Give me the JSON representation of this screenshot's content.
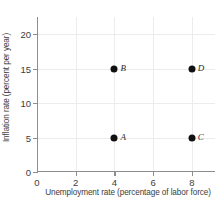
{
  "chart_data": {
    "type": "scatter",
    "title": "",
    "xlabel": "Unemployment rate (percentage of labor force)",
    "ylabel": "Inflation rate (percent per year)",
    "xlim": [
      0,
      9.2
    ],
    "ylim": [
      0,
      22.5
    ],
    "xticks": [
      0,
      2,
      4,
      6,
      8
    ],
    "yticks": [
      0,
      5,
      10,
      15,
      20
    ],
    "xtick_labels": [
      "0",
      "2",
      "4",
      "6",
      "8"
    ],
    "ytick_labels": [
      "0",
      "5",
      "10",
      "15",
      "20"
    ],
    "grid": true,
    "legend": "none",
    "points": [
      {
        "label": "A",
        "x": 4,
        "y": 5
      },
      {
        "label": "B",
        "x": 4,
        "y": 15
      },
      {
        "label": "C",
        "x": 8,
        "y": 5
      },
      {
        "label": "D",
        "x": 8,
        "y": 15
      }
    ],
    "colors": {
      "marker": "#111111",
      "axis": "#8e8e8e",
      "grid": "#ececed",
      "text": "#3d3d3d",
      "background": "#ffffff"
    }
  }
}
